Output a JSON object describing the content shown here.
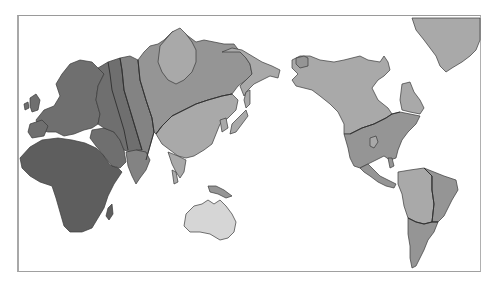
{
  "map": {
    "type": "world-map-pacific-centered",
    "style": "grayscale choropleth",
    "frame": {
      "x": 17,
      "y": 15,
      "width": 464,
      "height": 257
    },
    "shades": {
      "darkest": "#5e5e5e",
      "dark": "#6f6f6f",
      "medium_dark": "#838383",
      "medium": "#959595",
      "light": "#a9a9a9",
      "lightest": "#d6d6d6",
      "background": "#ffffff"
    },
    "regions": [
      {
        "name": "Africa",
        "shade": "darkest"
      },
      {
        "name": "Europe",
        "shade": "dark"
      },
      {
        "name": "Middle East / Arabia",
        "shade": "dark"
      },
      {
        "name": "Western Russia",
        "shade": "dark"
      },
      {
        "name": "Central Asia band",
        "shade": "medium_dark"
      },
      {
        "name": "Indian subcontinent",
        "shade": "medium_dark"
      },
      {
        "name": "Siberia",
        "shade": "medium"
      },
      {
        "name": "Central Siberian Plateau",
        "shade": "light"
      },
      {
        "name": "Russian Far East",
        "shade": "light"
      },
      {
        "name": "China / East Asia",
        "shade": "light"
      },
      {
        "name": "Japan",
        "shade": "light"
      },
      {
        "name": "Southeast Asia",
        "shade": "light"
      },
      {
        "name": "New Guinea",
        "shade": "medium"
      },
      {
        "name": "Australia",
        "shade": "lightest"
      },
      {
        "name": "Canada / Alaska",
        "shade": "light"
      },
      {
        "name": "Labrador",
        "shade": "light"
      },
      {
        "name": "Greenland",
        "shade": "light"
      },
      {
        "name": "United States / Mexico",
        "shade": "medium"
      },
      {
        "name": "Central America",
        "shade": "medium"
      },
      {
        "name": "Northern South America",
        "shade": "light"
      },
      {
        "name": "Eastern Brazil",
        "shade": "medium"
      },
      {
        "name": "Southern South America",
        "shade": "medium"
      }
    ]
  }
}
